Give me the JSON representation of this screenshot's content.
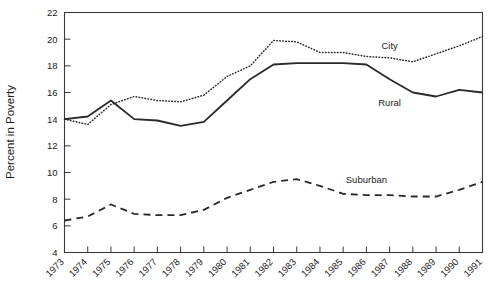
{
  "chart_data": {
    "type": "line",
    "title": "",
    "xlabel": "",
    "ylabel": "Percent in Poverty",
    "xlim": [
      1973,
      1991
    ],
    "ylim": [
      4,
      22
    ],
    "ytick_step": 2,
    "grid": false,
    "legend": "inline-labels",
    "x": [
      1973,
      1974,
      1975,
      1976,
      1977,
      1978,
      1979,
      1980,
      1981,
      1982,
      1983,
      1984,
      1985,
      1986,
      1987,
      1988,
      1989,
      1990,
      1991
    ],
    "categories": [
      "1973",
      "1974",
      "1975",
      "1976",
      "1977",
      "1978",
      "1979",
      "1980",
      "1981",
      "1982",
      "1983",
      "1984",
      "1985",
      "1986",
      "1987",
      "1988",
      "1989",
      "1990",
      "1991"
    ],
    "ytick_labels": [
      "4",
      "6",
      "8",
      "10",
      "12",
      "14",
      "16",
      "18",
      "20",
      "22"
    ],
    "series": [
      {
        "name": "City",
        "style": "dotted",
        "color": "#2a2a2a",
        "label_x": 1987,
        "label_y": 19.3,
        "values": [
          14.0,
          13.6,
          15.1,
          15.7,
          15.4,
          15.3,
          15.8,
          17.2,
          18.0,
          19.9,
          19.8,
          19.0,
          19.0,
          18.7,
          18.6,
          18.3,
          18.9,
          19.5,
          20.2
        ]
      },
      {
        "name": "Rural",
        "style": "solid",
        "color": "#2a2a2a",
        "label_x": 1987,
        "label_y": 15.0,
        "values": [
          14.0,
          14.2,
          15.4,
          14.0,
          13.9,
          13.5,
          13.8,
          15.4,
          17.0,
          18.1,
          18.2,
          18.2,
          18.2,
          18.1,
          17.0,
          16.0,
          15.7,
          16.2,
          16.0
        ]
      },
      {
        "name": "Suburban",
        "style": "dashed",
        "color": "#2a2a2a",
        "label_x": 1986,
        "label_y": 9.2,
        "values": [
          6.4,
          6.7,
          7.6,
          6.9,
          6.8,
          6.8,
          7.2,
          8.1,
          8.7,
          9.3,
          9.5,
          9.0,
          8.4,
          8.3,
          8.3,
          8.2,
          8.2,
          8.7,
          9.3
        ]
      }
    ]
  },
  "figure": {
    "background_color": "#ffffff",
    "axis_color": "#3a3a3a",
    "text_color": "#1c1c1c"
  }
}
